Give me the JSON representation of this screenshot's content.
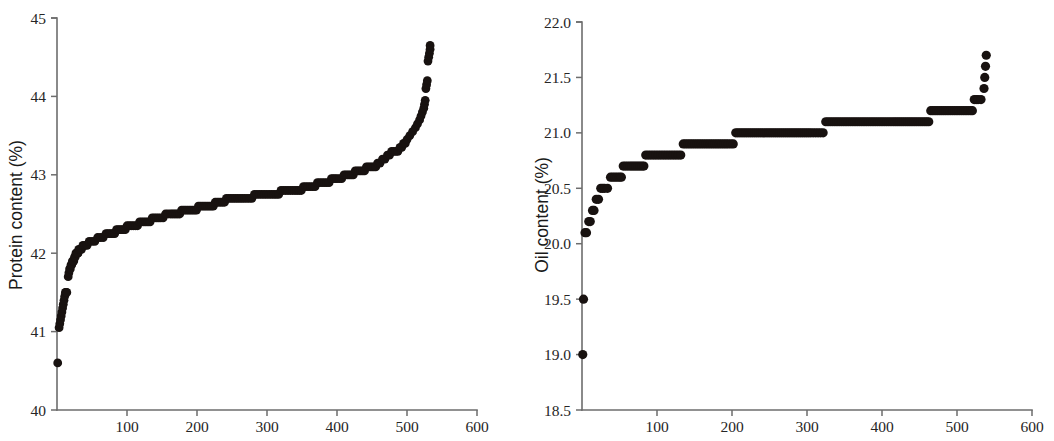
{
  "figure": {
    "background": "#ffffff",
    "marker_color": "#181210",
    "axis_color": "#6d6d6d",
    "panels": [
      "protein",
      "oil"
    ]
  },
  "chart_data": [
    {
      "type": "scatter",
      "id": "protein",
      "title": "",
      "xlabel": "",
      "ylabel": "Protein content (%)",
      "xlim": [
        0,
        600
      ],
      "ylim": [
        40,
        45
      ],
      "xticks": [
        100,
        200,
        300,
        400,
        500,
        600
      ],
      "xtick_labels": [
        "100",
        "200",
        "300",
        "400",
        "500",
        "600"
      ],
      "yticks": [
        40,
        41,
        42,
        43,
        44,
        45
      ],
      "ytick_labels": [
        "40",
        "41",
        "42",
        "43",
        "44",
        "45"
      ],
      "grid": false,
      "legend": "none",
      "marker": "filled-circle",
      "description": "Ranked (sorted ascending) protein content of 533 accessions; a monotone step-curve rising from 40.6% to 44.65%.",
      "points": [
        [
          1,
          40.6
        ],
        [
          3,
          41.05
        ],
        [
          4,
          41.1
        ],
        [
          5,
          41.15
        ],
        [
          6,
          41.2
        ],
        [
          7,
          41.25
        ],
        [
          8,
          41.3
        ],
        [
          9,
          41.35
        ],
        [
          10,
          41.4
        ],
        [
          11,
          41.45
        ],
        [
          12,
          41.5
        ],
        [
          13,
          41.5
        ],
        [
          14,
          41.5
        ],
        [
          16,
          41.7
        ],
        [
          17,
          41.75
        ],
        [
          18,
          41.8
        ],
        [
          19,
          41.8
        ],
        [
          20,
          41.85
        ],
        [
          21,
          41.85
        ],
        [
          22,
          41.9
        ],
        [
          23,
          41.9
        ],
        [
          24,
          41.9
        ],
        [
          25,
          41.95
        ],
        [
          26,
          41.95
        ],
        [
          27,
          42.0
        ],
        [
          28,
          42.0
        ],
        [
          29,
          42.0
        ],
        [
          30,
          42.0
        ],
        [
          31,
          42.05
        ],
        [
          33,
          42.05
        ],
        [
          35,
          42.05
        ],
        [
          37,
          42.1
        ],
        [
          40,
          42.1
        ],
        [
          43,
          42.1
        ],
        [
          46,
          42.15
        ],
        [
          50,
          42.15
        ],
        [
          54,
          42.15
        ],
        [
          58,
          42.2
        ],
        [
          62,
          42.2
        ],
        [
          66,
          42.2
        ],
        [
          70,
          42.25
        ],
        [
          75,
          42.25
        ],
        [
          80,
          42.25
        ],
        [
          85,
          42.3
        ],
        [
          90,
          42.3
        ],
        [
          95,
          42.3
        ],
        [
          100,
          42.35
        ],
        [
          106,
          42.35
        ],
        [
          112,
          42.35
        ],
        [
          118,
          42.4
        ],
        [
          124,
          42.4
        ],
        [
          130,
          42.4
        ],
        [
          136,
          42.45
        ],
        [
          142,
          42.45
        ],
        [
          148,
          42.45
        ],
        [
          155,
          42.5
        ],
        [
          162,
          42.5
        ],
        [
          170,
          42.5
        ],
        [
          178,
          42.55
        ],
        [
          186,
          42.55
        ],
        [
          194,
          42.55
        ],
        [
          202,
          42.6
        ],
        [
          210,
          42.6
        ],
        [
          218,
          42.6
        ],
        [
          226,
          42.65
        ],
        [
          234,
          42.65
        ],
        [
          242,
          42.7
        ],
        [
          255,
          42.7
        ],
        [
          268,
          42.7
        ],
        [
          282,
          42.75
        ],
        [
          296,
          42.75
        ],
        [
          310,
          42.75
        ],
        [
          320,
          42.8
        ],
        [
          330,
          42.8
        ],
        [
          340,
          42.8
        ],
        [
          352,
          42.85
        ],
        [
          362,
          42.85
        ],
        [
          372,
          42.9
        ],
        [
          382,
          42.9
        ],
        [
          392,
          42.95
        ],
        [
          400,
          42.95
        ],
        [
          410,
          43.0
        ],
        [
          418,
          43.0
        ],
        [
          426,
          43.05
        ],
        [
          434,
          43.05
        ],
        [
          442,
          43.1
        ],
        [
          450,
          43.1
        ],
        [
          458,
          43.15
        ],
        [
          465,
          43.2
        ],
        [
          472,
          43.25
        ],
        [
          478,
          43.3
        ],
        [
          484,
          43.3
        ],
        [
          490,
          43.35
        ],
        [
          495,
          43.4
        ],
        [
          500,
          43.45
        ],
        [
          504,
          43.5
        ],
        [
          508,
          43.55
        ],
        [
          512,
          43.6
        ],
        [
          515,
          43.65
        ],
        [
          518,
          43.7
        ],
        [
          520,
          43.75
        ],
        [
          522,
          43.8
        ],
        [
          524,
          43.85
        ],
        [
          525,
          43.9
        ],
        [
          526,
          43.95
        ],
        [
          527,
          44.1
        ],
        [
          528,
          44.15
        ],
        [
          529,
          44.2
        ],
        [
          530,
          44.45
        ],
        [
          531,
          44.5
        ],
        [
          532,
          44.55
        ],
        [
          533,
          44.6
        ],
        [
          533,
          44.65
        ]
      ]
    },
    {
      "type": "scatter",
      "id": "oil",
      "title": "",
      "xlabel": "",
      "ylabel": "Oil content (%)",
      "xlim": [
        0,
        600
      ],
      "ylim": [
        18.5,
        22.0
      ],
      "xticks": [
        100,
        200,
        300,
        400,
        500,
        600
      ],
      "xtick_labels": [
        "100",
        "200",
        "300",
        "400",
        "500",
        "600"
      ],
      "yticks": [
        18.5,
        19.0,
        19.5,
        20.0,
        20.5,
        21.0,
        21.5,
        22.0
      ],
      "ytick_labels": [
        "18.5",
        "19.0",
        "19.5",
        "20.0",
        "20.5",
        "21.0",
        "21.5",
        "22.0"
      ],
      "grid": false,
      "legend": "none",
      "marker": "filled-circle",
      "description": "Ranked (sorted ascending) oil content of ~540 accessions; two low outliers at 19.0 and 19.5 then a plateau-step curve from 20.1% up to 21.7%.",
      "points": [
        [
          1,
          19.0
        ],
        [
          2,
          19.5
        ],
        [
          4,
          20.1
        ],
        [
          6,
          20.1
        ],
        [
          9,
          20.2
        ],
        [
          11,
          20.2
        ],
        [
          14,
          20.3
        ],
        [
          16,
          20.3
        ],
        [
          19,
          20.4
        ],
        [
          22,
          20.4
        ],
        [
          25,
          20.5
        ],
        [
          30,
          20.5
        ],
        [
          34,
          20.5
        ],
        [
          38,
          20.6
        ],
        [
          44,
          20.6
        ],
        [
          50,
          20.6
        ],
        [
          55,
          20.7
        ],
        [
          64,
          20.7
        ],
        [
          72,
          20.7
        ],
        [
          80,
          20.7
        ],
        [
          85,
          20.8
        ],
        [
          95,
          20.8
        ],
        [
          105,
          20.8
        ],
        [
          115,
          20.8
        ],
        [
          125,
          20.8
        ],
        [
          135,
          20.9
        ],
        [
          150,
          20.9
        ],
        [
          165,
          20.9
        ],
        [
          180,
          20.9
        ],
        [
          195,
          20.9
        ],
        [
          205,
          21.0
        ],
        [
          230,
          21.0
        ],
        [
          255,
          21.0
        ],
        [
          280,
          21.0
        ],
        [
          305,
          21.0
        ],
        [
          318,
          21.0
        ],
        [
          325,
          21.1
        ],
        [
          355,
          21.1
        ],
        [
          385,
          21.1
        ],
        [
          415,
          21.1
        ],
        [
          440,
          21.1
        ],
        [
          457,
          21.1
        ],
        [
          465,
          21.2
        ],
        [
          485,
          21.2
        ],
        [
          500,
          21.2
        ],
        [
          512,
          21.2
        ],
        [
          518,
          21.2
        ],
        [
          523,
          21.3
        ],
        [
          528,
          21.3
        ],
        [
          532,
          21.3
        ],
        [
          536,
          21.4
        ],
        [
          537,
          21.5
        ],
        [
          538,
          21.6
        ],
        [
          539,
          21.7
        ]
      ]
    }
  ]
}
